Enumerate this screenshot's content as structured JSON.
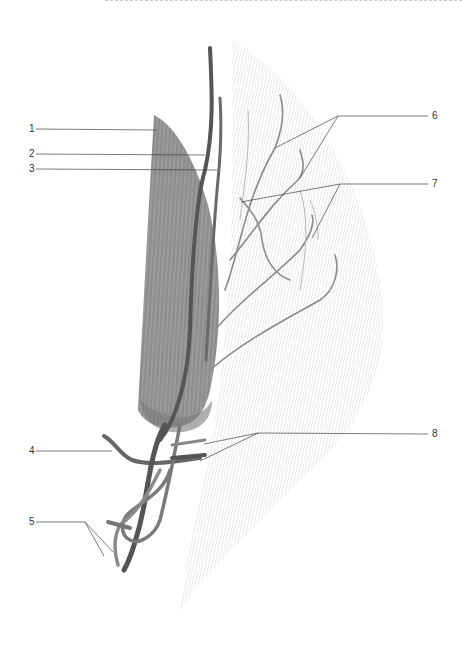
{
  "figure": {
    "colors": {
      "muscle": "#8a8a8a",
      "vessel_dark": "#555555",
      "vessel_light": "#9a9a9a",
      "fascia_hatch": "#d6d6d6",
      "leader_line": "#444444",
      "label_text": "#333333"
    }
  },
  "labels": [
    {
      "id": "1",
      "text": "1",
      "side": "left",
      "points_to": "muscle belly"
    },
    {
      "id": "2",
      "text": "2",
      "side": "left",
      "points_to": "main vessel (dark)"
    },
    {
      "id": "3",
      "text": "3",
      "side": "left",
      "points_to": "accompanying vessel"
    },
    {
      "id": "4",
      "text": "4",
      "side": "left",
      "points_to": "proximal branch loop"
    },
    {
      "id": "5",
      "text": "5",
      "side": "left",
      "points_to": "two vessel trunks (base)"
    },
    {
      "id": "6",
      "text": "6",
      "side": "right",
      "points_to": "two branches over fascia"
    },
    {
      "id": "7",
      "text": "7",
      "side": "right",
      "points_to": "two branches over fascia"
    },
    {
      "id": "8",
      "text": "8",
      "side": "right",
      "points_to": "two cut vessel ends"
    }
  ]
}
